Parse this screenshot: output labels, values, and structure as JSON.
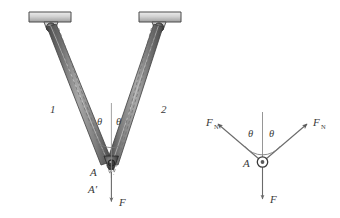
{
  "figure": {
    "background_color": "#ffffff",
    "line_color": "#4a4a4a",
    "bar_dark": "#4d4d4d",
    "bar_mid": "#8c8c8c",
    "bar_light": "#d8d8d8",
    "support_fill": "#cfcfcf",
    "text_color": "#3a3a3a"
  },
  "truss": {
    "members": [
      {
        "id": "member-1",
        "label": "1"
      },
      {
        "id": "member-2",
        "label": "2"
      }
    ],
    "angles": [
      {
        "id": "theta-left",
        "label": "θ"
      },
      {
        "id": "theta-right",
        "label": "θ"
      }
    ],
    "joints": [
      {
        "id": "joint-A",
        "label": "A"
      },
      {
        "id": "joint-A-prime",
        "label": "A′"
      }
    ],
    "load": {
      "id": "load-F",
      "label": "F"
    },
    "supports": [
      {
        "id": "support-left",
        "type": "pin-bracket"
      },
      {
        "id": "support-right",
        "type": "pin-bracket"
      }
    ]
  },
  "fbd": {
    "center_label": "A",
    "forces": [
      {
        "id": "force-left",
        "label": "F",
        "subscript": "N",
        "direction": "up-left"
      },
      {
        "id": "force-right",
        "label": "F",
        "subscript": "N",
        "direction": "up-right"
      },
      {
        "id": "force-down",
        "label": "F",
        "subscript": "",
        "direction": "down"
      }
    ],
    "angles": [
      {
        "id": "fbd-theta-left",
        "label": "θ"
      },
      {
        "id": "fbd-theta-right",
        "label": "θ"
      }
    ]
  }
}
